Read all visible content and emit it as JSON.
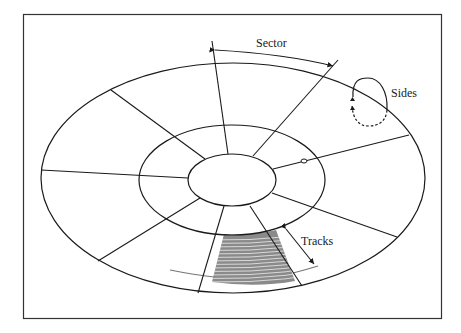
{
  "diagram": {
    "type": "floppy-disk-geometry",
    "labels": {
      "sector": "Sector",
      "sides": "Sides",
      "tracks": "Tracks"
    },
    "colors": {
      "stroke": "#1a1a1a",
      "frame": "#333333",
      "track_shading": "#555555",
      "background": "#ffffff"
    },
    "rings": [
      {
        "name": "outer-edge",
        "cx": 233,
        "cy": 178,
        "rx": 192,
        "ry": 115
      },
      {
        "name": "middle-ring",
        "cx": 232,
        "cy": 180,
        "rx": 93,
        "ry": 55
      },
      {
        "name": "hub",
        "cx": 232,
        "cy": 180,
        "rx": 44,
        "ry": 26
      }
    ],
    "sector_count": 8
  }
}
